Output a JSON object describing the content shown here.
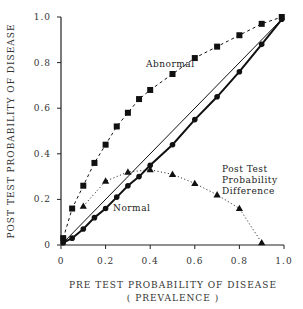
{
  "chart_data": {
    "type": "line",
    "title": "",
    "xlabel": "PRE TEST PROBABILITY OF DISEASE",
    "xlabel_sub": "( PREVALENCE )",
    "ylabel": "POST TEST PROBABILITY OF DISEASE",
    "xlim": [
      0,
      1.0
    ],
    "ylim": [
      0,
      1.0
    ],
    "grid": false,
    "x_ticks": [
      0,
      0.2,
      0.4,
      0.6,
      0.8,
      1.0
    ],
    "x_tick_labels": [
      "0",
      "0.2",
      "0.4",
      "0.6",
      "0.8",
      "1.0"
    ],
    "y_ticks": [
      0,
      0.2,
      0.4,
      0.6,
      0.8,
      1.0
    ],
    "y_tick_labels": [
      "0",
      "0.2",
      "0.4",
      "0.6",
      "0.8",
      "1.0"
    ],
    "series": [
      {
        "name": "Abnormal",
        "marker": "square",
        "line": "dashed",
        "x": [
          0.01,
          0.05,
          0.1,
          0.15,
          0.2,
          0.25,
          0.3,
          0.35,
          0.4,
          0.5,
          0.6,
          0.7,
          0.8,
          0.9,
          0.99
        ],
        "values": [
          0.03,
          0.16,
          0.26,
          0.36,
          0.44,
          0.52,
          0.58,
          0.64,
          0.68,
          0.75,
          0.82,
          0.87,
          0.92,
          0.97,
          1.0
        ]
      },
      {
        "name": "Normal",
        "marker": "circle",
        "line": "solid-thick",
        "x": [
          0.01,
          0.05,
          0.1,
          0.15,
          0.2,
          0.25,
          0.3,
          0.35,
          0.4,
          0.5,
          0.6,
          0.7,
          0.8,
          0.9,
          0.99
        ],
        "values": [
          0.01,
          0.03,
          0.07,
          0.12,
          0.16,
          0.21,
          0.26,
          0.3,
          0.35,
          0.44,
          0.55,
          0.65,
          0.76,
          0.88,
          0.99
        ]
      },
      {
        "name": "Post Test Probability Difference",
        "marker": "triangle",
        "line": "dotted",
        "x": [
          0.1,
          0.2,
          0.3,
          0.4,
          0.5,
          0.6,
          0.7,
          0.8,
          0.9
        ],
        "values": [
          0.17,
          0.28,
          0.32,
          0.33,
          0.31,
          0.27,
          0.22,
          0.16,
          0.01
        ]
      },
      {
        "name": "Identity (y = x)",
        "marker": "none",
        "line": "solid-thin",
        "x": [
          0,
          1.0
        ],
        "values": [
          0,
          1.0
        ]
      }
    ],
    "annotations": [
      {
        "text": "Abnormal",
        "x": 0.38,
        "y": 0.79
      },
      {
        "text": "Normal",
        "x": 0.26,
        "y": 0.18
      },
      {
        "text": "Post Test",
        "x": 0.7,
        "y": 0.36,
        "line": 1
      },
      {
        "text": "Probability",
        "x": 0.7,
        "y": 0.31,
        "line": 2
      },
      {
        "text": "Difference",
        "x": 0.7,
        "y": 0.26,
        "line": 3
      }
    ]
  },
  "labels": {
    "abnormal": "Abnormal",
    "normal": "Normal",
    "diff_line1": "Post Test",
    "diff_line2": "Probability",
    "diff_line3": "Difference",
    "xlabel": "PRE TEST PROBABILITY OF DISEASE",
    "xlabel_sub": "( PREVALENCE )",
    "ylabel": "POST TEST PROBABILITY OF DISEASE"
  }
}
